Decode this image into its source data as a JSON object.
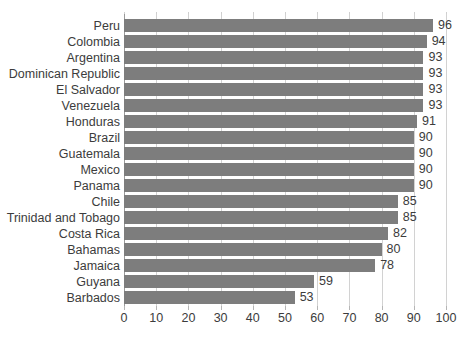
{
  "chart_data": {
    "type": "bar",
    "orientation": "horizontal",
    "title": "",
    "subtitle": "",
    "xlabel": "",
    "ylabel": "",
    "xlim": [
      0,
      100
    ],
    "xticks": [
      0,
      10,
      20,
      30,
      40,
      50,
      60,
      70,
      80,
      90,
      100
    ],
    "grid": true,
    "legend": false,
    "bar_color": "#7d7d7d",
    "gridline_color": "#d2d2d2",
    "axis_color": "#9a9a9a",
    "text_color": "#3c3c3c",
    "categories": [
      "Peru",
      "Colombia",
      "Argentina",
      "Dominican Republic",
      "El Salvador",
      "Venezuela",
      "Honduras",
      "Brazil",
      "Guatemala",
      "Mexico",
      "Panama",
      "Chile",
      "Trinidad and Tobago",
      "Costa Rica",
      "Bahamas",
      "Jamaica",
      "Guyana",
      "Barbados"
    ],
    "values": [
      96,
      94,
      93,
      93,
      93,
      93,
      91,
      90,
      90,
      90,
      90,
      85,
      85,
      82,
      80,
      78,
      59,
      53
    ],
    "data_labels": [
      "96",
      "94",
      "93",
      "93",
      "93",
      "93",
      "91",
      "90",
      "90",
      "90",
      "90",
      "85",
      "85",
      "82",
      "80",
      "78",
      "59",
      "53"
    ]
  },
  "footer": {
    "cropped_text": ""
  }
}
